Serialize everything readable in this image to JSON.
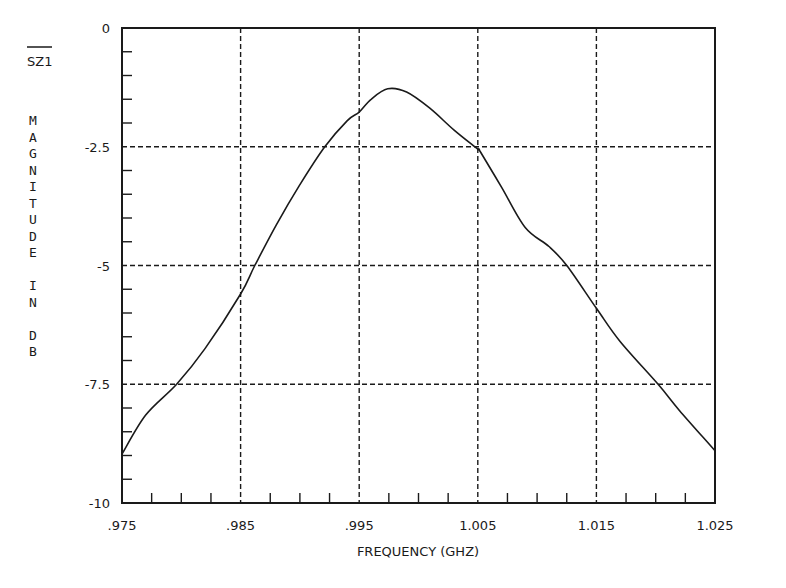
{
  "chart_data": {
    "type": "line",
    "title": "",
    "series_label": "SZ1",
    "xlabel": "FREQUENCY (GHZ)",
    "ylabel": "MAGNITUDE IN DB",
    "xlim": [
      0.975,
      1.025
    ],
    "ylim": [
      -10,
      0
    ],
    "x_ticks": [
      0.975,
      0.985,
      0.995,
      1.005,
      1.015,
      1.025
    ],
    "x_tick_labels": [
      ".975",
      ".985",
      ".995",
      "1.005",
      "1.015",
      "1.025"
    ],
    "y_ticks": [
      0,
      -2.5,
      -5,
      -7.5,
      -10
    ],
    "y_tick_labels": [
      "0",
      "-2.5",
      "-5",
      "-7.5",
      "-10"
    ],
    "x_minor_step": 0.0025,
    "y_minor_step": 0.5,
    "grid": true,
    "grid_style": "dashed",
    "legend": "none",
    "series": [
      {
        "name": "SZ1",
        "x": [
          0.975,
          0.977,
          0.9796,
          0.982,
          0.985,
          0.9862,
          0.988,
          0.99,
          0.9921,
          0.994,
          0.995,
          0.996,
          0.9974,
          0.999,
          1.001,
          1.003,
          1.005,
          1.0052,
          1.007,
          1.009,
          1.011,
          1.0125,
          1.015,
          1.017,
          1.0202,
          1.022,
          1.025
        ],
        "y": [
          -8.97,
          -8.15,
          -7.5,
          -6.75,
          -5.6,
          -5.0,
          -4.15,
          -3.3,
          -2.5,
          -1.95,
          -1.77,
          -1.5,
          -1.28,
          -1.35,
          -1.7,
          -2.15,
          -2.55,
          -2.6,
          -3.35,
          -4.2,
          -4.6,
          -5.0,
          -5.9,
          -6.6,
          -7.5,
          -8.05,
          -8.9
        ]
      }
    ]
  },
  "labels": {
    "series_label": "SZ1",
    "ylabel_chars": [
      "M",
      "A",
      "G",
      "N",
      "I",
      "T",
      "U",
      "D",
      "E",
      "",
      "I",
      "N",
      "",
      "D",
      "B"
    ],
    "xlabel": "FREQUENCY (GHZ)"
  },
  "colors": {
    "ink": "#1a1a1a",
    "background": "#ffffff"
  }
}
